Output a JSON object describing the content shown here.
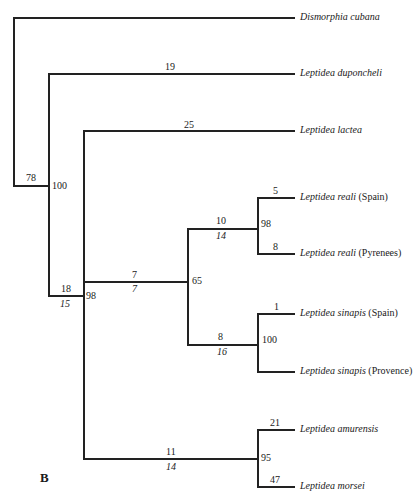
{
  "figure": {
    "panel_label": "B",
    "taxa": [
      {
        "name": "Dismorphia cubana",
        "locality": ""
      },
      {
        "name": "Leptidea duponcheli",
        "locality": ""
      },
      {
        "name": "Leptidea lactea",
        "locality": ""
      },
      {
        "name": "Leptidea reali",
        "locality": "(Spain)"
      },
      {
        "name": "Leptidea reali",
        "locality": "(Pyrenees)"
      },
      {
        "name": "Leptidea sinapis",
        "locality": "(Spain)"
      },
      {
        "name": "Leptidea sinapis",
        "locality": "(Provence)"
      },
      {
        "name": "Leptidea amurensis",
        "locality": ""
      },
      {
        "name": "Leptidea morsei",
        "locality": ""
      }
    ],
    "branch_lengths": {
      "duponcheli": "19",
      "lactea": "25",
      "reali_clade": "10",
      "reali_spain": "5",
      "reali_pyrenees": "8",
      "ingroup_core": "7",
      "sinapis_clade": "8",
      "sinapis_spain": "1",
      "amurensis_clade": "11",
      "amurensis": "21",
      "morsei": "47",
      "root_stem": "78",
      "lactea_stem": "18"
    },
    "decay_indices": {
      "reali_clade": "14",
      "ingroup_core": "7",
      "sinapis_clade": "16",
      "amurensis_clade": "14",
      "lactea_stem": "15"
    },
    "bootstrap": {
      "duponcheli_node": "100",
      "ingroup_node": "98",
      "core_node": "65",
      "reali_node": "98",
      "sinapis_node": "100",
      "amurensis_node": "95"
    }
  }
}
